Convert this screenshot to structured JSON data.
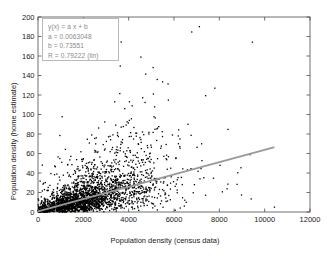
{
  "chart_data": {
    "type": "scatter",
    "title": "",
    "xlabel": "Population density (census data)",
    "ylabel": "Population density (home estimate)",
    "xlim": [
      0,
      12000
    ],
    "ylim": [
      0,
      200
    ],
    "xticks": [
      0,
      2000,
      4000,
      6000,
      8000,
      10000,
      12000
    ],
    "yticks": [
      0,
      20,
      40,
      60,
      80,
      100,
      120,
      140,
      160,
      180,
      200
    ],
    "xticklabels": [
      "0",
      "2000",
      "4000",
      "6000",
      "8000",
      "10000",
      "12000"
    ],
    "yticklabels": [
      "0",
      "20",
      "40",
      "60",
      "80",
      "100",
      "120",
      "140",
      "160",
      "180",
      "200"
    ],
    "grid": false,
    "legend_position": "upper-left",
    "marker": {
      "shape": "dot",
      "color": "#000000",
      "size": 1.3
    },
    "series": [
      {
        "name": "observations",
        "kind": "scatter",
        "description": "Dense black point cloud, highest concentration below y=40 for x<6000, fanning upward with increasing x; sparse outliers reach y=140 and x=10500.",
        "n_points_drawn": 2600,
        "density_model": {
          "x_distribution": "gamma-like, mode near 1500, long right tail to 10500",
          "y_given_x": "lognormal-like about the fit line, floor at 0"
        }
      },
      {
        "name": "linear fit",
        "kind": "line",
        "color": "#999999",
        "width": 1.8,
        "x": [
          0,
          10400
        ],
        "y": [
          0.73551,
          66.3
        ]
      }
    ],
    "fit": {
      "equation": "y(x) = a x + b",
      "a_label": "a = 0.0063048",
      "b_label": "b = 0.73551",
      "r_label": "R = 0.79222  (lin)",
      "a": 0.0063048,
      "b": 0.73551,
      "R": 0.79222,
      "method": "lin"
    }
  },
  "legend": {
    "lines": [
      "y(x) = a x + b",
      "a = 0.0063048",
      "b = 0.73551",
      "R = 0.79222  (lin)"
    ]
  },
  "colors": {
    "axis": "#4d4d4d",
    "point": "#000000",
    "fit_line": "#999999",
    "legend_text": "#8a8a8a",
    "legend_border": "#b9b9b9",
    "background": "#ffffff"
  }
}
